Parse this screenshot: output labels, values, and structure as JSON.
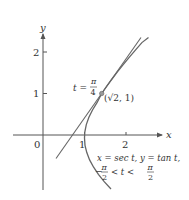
{
  "figure": {
    "axes": {
      "x_label": "x",
      "y_label": "y",
      "origin_label": "0",
      "x_ticks": [
        "1",
        "2"
      ],
      "y_ticks": [
        "1",
        "2"
      ]
    },
    "curve": {
      "equation_line1": "x = sec t, y = tan t,",
      "interval_left": "−",
      "interval_left_num": "π",
      "interval_left_den": "2",
      "interval_mid": "< t <",
      "interval_right_num": "π",
      "interval_right_den": "2"
    },
    "point": {
      "param_label": "t =",
      "param_num": "π",
      "param_den": "4",
      "coords": "(√2, 1)"
    },
    "colors": {
      "curve": "#666666",
      "axis": "#555555",
      "text": "#333333",
      "point": "#999999"
    }
  }
}
